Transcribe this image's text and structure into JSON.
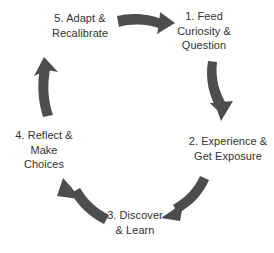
{
  "diagram": {
    "type": "cycle",
    "background_color": "#ffffff",
    "arrow_color": "#4d4d4d",
    "text_color": "#333333",
    "stage_count": 5,
    "stages": [
      {
        "id": "stage-1",
        "number": "1.",
        "label": "1. Feed\nCuriosity &\nQuestion",
        "lines": [
          "1. Feed",
          "Curiosity &",
          "Question"
        ],
        "position": "top-right"
      },
      {
        "id": "stage-2",
        "number": "2.",
        "label": "2. Experience &\nGet Exposure",
        "lines": [
          "2. Experience &",
          "Get Exposure"
        ],
        "position": "right"
      },
      {
        "id": "stage-3",
        "number": "3.",
        "label": "3. Discover\n& Learn",
        "lines": [
          "3. Discover",
          "& Learn"
        ],
        "position": "bottom"
      },
      {
        "id": "stage-4",
        "number": "4.",
        "label": "4. Reflect &\nMake\nChoices",
        "lines": [
          "4. Reflect &",
          "Make",
          "Choices"
        ],
        "position": "left"
      },
      {
        "id": "stage-5",
        "number": "5.",
        "label": "5. Adapt &\nRecalibrate",
        "lines": [
          "5. Adapt &",
          "Recalibrate"
        ],
        "position": "top-left"
      }
    ],
    "arrows": [
      {
        "id": "arrow-5-to-1",
        "from": "stage-5",
        "to": "stage-1",
        "direction": "right"
      },
      {
        "id": "arrow-1-to-2",
        "from": "stage-1",
        "to": "stage-2",
        "direction": "down"
      },
      {
        "id": "arrow-2-to-3",
        "from": "stage-2",
        "to": "stage-3",
        "direction": "down-left"
      },
      {
        "id": "arrow-3-to-4",
        "from": "stage-3",
        "to": "stage-4",
        "direction": "up-left"
      },
      {
        "id": "arrow-4-to-5",
        "from": "stage-4",
        "to": "stage-5",
        "direction": "up"
      }
    ]
  }
}
